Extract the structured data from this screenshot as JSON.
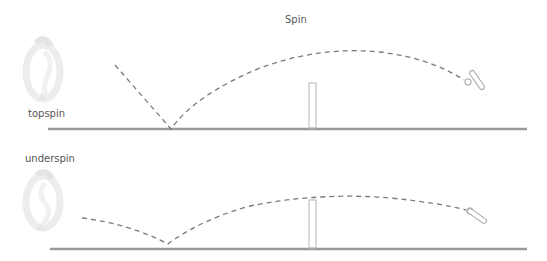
{
  "diagram": {
    "title": "Spin",
    "colors": {
      "ground": "#9a9a9a",
      "trajectory": "#7a7a7a",
      "net": "#b5b5b5",
      "icon": "#e6e6e6",
      "text": "#555555"
    },
    "panels": [
      {
        "label": "topspin",
        "spin_direction": "forward",
        "ground_y": 129,
        "bounce_point": [
          171,
          129
        ],
        "apex": [
          340,
          53
        ],
        "ball": [
          467,
          80
        ]
      },
      {
        "label": "underspin",
        "spin_direction": "backward",
        "ground_y": 249,
        "bounce_point": [
          168,
          244
        ],
        "apex": [
          320,
          197
        ],
        "ball": [
          470,
          211
        ]
      }
    ]
  }
}
